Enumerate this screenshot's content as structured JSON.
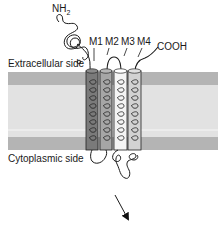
{
  "diagram": {
    "type": "membrane-protein-topology",
    "labels": {
      "n_terminus": "NH",
      "n_terminus_sub": "2",
      "c_terminus": "COOH",
      "extracellular": "Extracellular side",
      "cytoplasmic": "Cytoplasmic side"
    },
    "segments": [
      {
        "id": "M1",
        "label": "M1",
        "color": "#7a7a7a"
      },
      {
        "id": "M2",
        "label": "M2",
        "color": "#a6a6a6"
      },
      {
        "id": "M3",
        "label": "M3",
        "color": "#f4f4f4"
      },
      {
        "id": "M4",
        "label": "M4",
        "color": "#d2d2d2"
      }
    ],
    "membrane": {
      "outer_band_color": "#b4b4b4",
      "core_color": "#e2e2e2"
    },
    "arrow": {
      "direction": "down-right"
    }
  }
}
